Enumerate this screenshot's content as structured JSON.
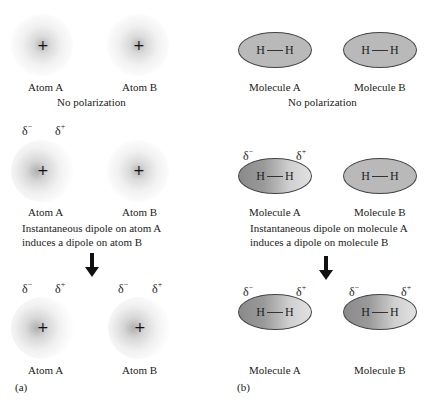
{
  "panel_a": {
    "label": "(a)",
    "row1": {
      "atom_a": "Atom A",
      "atom_b": "Atom B",
      "caption": "No polarization",
      "nucleus_symbol": "+"
    },
    "row2": {
      "delta_minus": "δ",
      "delta_plus": "δ",
      "minus_sign": "−",
      "plus_sign": "+",
      "atom_a": "Atom A",
      "atom_b": "Atom B",
      "caption_line1": "Instantaneous dipole on atom A",
      "caption_line2": "induces a dipole on atom B",
      "nucleus_symbol": "+"
    },
    "row3": {
      "delta_minus": "δ",
      "delta_plus": "δ",
      "minus_sign": "−",
      "plus_sign": "+",
      "atom_a": "Atom A",
      "atom_b": "Atom B",
      "nucleus_symbol": "+"
    }
  },
  "panel_b": {
    "label": "(b)",
    "h_atom": "H",
    "row1": {
      "molecule_a": "Molecule A",
      "molecule_b": "Molecule B",
      "caption": "No polarization"
    },
    "row2": {
      "delta_minus": "δ",
      "delta_plus": "δ",
      "minus_sign": "−",
      "plus_sign": "+",
      "molecule_a": "Molecule A",
      "molecule_b": "Molecule B",
      "caption_line1": "Instantaneous dipole on molecule A",
      "caption_line2": "induces a dipole on molecule B"
    },
    "row3": {
      "delta_minus": "δ",
      "delta_plus": "δ",
      "minus_sign": "−",
      "plus_sign": "+",
      "molecule_a": "Molecule A",
      "molecule_b": "Molecule B"
    }
  },
  "colors": {
    "ellipse_fill": "#b9b9b9",
    "gradient_dark": "#8a8a8a",
    "gradient_light": "#e2e2e2",
    "arrow": "#111111"
  }
}
